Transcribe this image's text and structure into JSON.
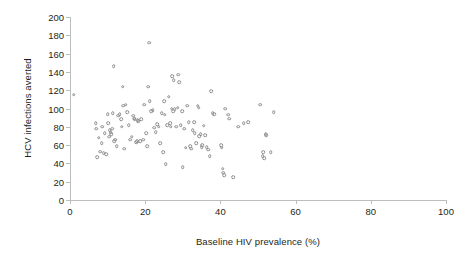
{
  "chart_data": {
    "type": "scatter",
    "title": "",
    "xlabel": "Baseline HIV prevalence (%)",
    "ylabel": "HCV infections averted",
    "xlim": [
      0,
      100
    ],
    "ylim": [
      0,
      200
    ],
    "xticks": [
      0,
      20,
      40,
      60,
      80,
      100
    ],
    "yticks": [
      0,
      20,
      40,
      60,
      80,
      100,
      120,
      140,
      160,
      180,
      200
    ],
    "grid": false,
    "legend": null,
    "marker": "open-circle",
    "marker_color": "#8d8d8d",
    "series": [
      {
        "name": "HCV infections averted vs baseline HIV prevalence",
        "points": [
          [
            1.0,
            115
          ],
          [
            6.8,
            84
          ],
          [
            7.0,
            78
          ],
          [
            7.2,
            47
          ],
          [
            7.6,
            68
          ],
          [
            8.0,
            53
          ],
          [
            8.4,
            62
          ],
          [
            8.6,
            80
          ],
          [
            9.0,
            51
          ],
          [
            9.2,
            73
          ],
          [
            9.6,
            50
          ],
          [
            10.0,
            94
          ],
          [
            10.2,
            84
          ],
          [
            10.4,
            69
          ],
          [
            10.6,
            76
          ],
          [
            10.8,
            74
          ],
          [
            11.0,
            72
          ],
          [
            11.2,
            78
          ],
          [
            11.4,
            95
          ],
          [
            11.6,
            146
          ],
          [
            11.8,
            64
          ],
          [
            12.0,
            66
          ],
          [
            12.4,
            59
          ],
          [
            12.8,
            92
          ],
          [
            13.2,
            94
          ],
          [
            13.6,
            88
          ],
          [
            13.8,
            80
          ],
          [
            14.0,
            124
          ],
          [
            14.2,
            103
          ],
          [
            14.4,
            56
          ],
          [
            14.8,
            104
          ],
          [
            15.2,
            96
          ],
          [
            15.6,
            82
          ],
          [
            16.0,
            66
          ],
          [
            16.4,
            69
          ],
          [
            16.8,
            92
          ],
          [
            17.0,
            89
          ],
          [
            17.2,
            88
          ],
          [
            17.6,
            63
          ],
          [
            17.8,
            64
          ],
          [
            18.0,
            87
          ],
          [
            18.2,
            86
          ],
          [
            18.6,
            64
          ],
          [
            19.0,
            88
          ],
          [
            19.4,
            66
          ],
          [
            19.8,
            104
          ],
          [
            20.2,
            73
          ],
          [
            20.6,
            59
          ],
          [
            20.8,
            124
          ],
          [
            21.0,
            172
          ],
          [
            21.2,
            108
          ],
          [
            21.6,
            97
          ],
          [
            22.0,
            98
          ],
          [
            22.4,
            79
          ],
          [
            22.8,
            74
          ],
          [
            23.2,
            83
          ],
          [
            23.6,
            80
          ],
          [
            24.0,
            62
          ],
          [
            24.4,
            95
          ],
          [
            24.8,
            52
          ],
          [
            25.0,
            108
          ],
          [
            25.2,
            93
          ],
          [
            25.4,
            39
          ],
          [
            25.8,
            82
          ],
          [
            26.2,
            113
          ],
          [
            26.6,
            84
          ],
          [
            26.8,
            80
          ],
          [
            27.0,
            100
          ],
          [
            27.2,
            135
          ],
          [
            27.4,
            97
          ],
          [
            27.6,
            131
          ],
          [
            27.8,
            99
          ],
          [
            28.2,
            80
          ],
          [
            28.6,
            101
          ],
          [
            28.8,
            137
          ],
          [
            29.0,
            129
          ],
          [
            29.4,
            82
          ],
          [
            29.8,
            97
          ],
          [
            30.0,
            36
          ],
          [
            30.4,
            78
          ],
          [
            30.8,
            57
          ],
          [
            31.2,
            103
          ],
          [
            31.6,
            85
          ],
          [
            32.0,
            59
          ],
          [
            32.2,
            56
          ],
          [
            32.6,
            76
          ],
          [
            33.0,
            85
          ],
          [
            33.2,
            73
          ],
          [
            33.6,
            62
          ],
          [
            34.0,
            103
          ],
          [
            34.2,
            101
          ],
          [
            34.4,
            70
          ],
          [
            34.8,
            72
          ],
          [
            35.0,
            58
          ],
          [
            35.2,
            60
          ],
          [
            35.6,
            81
          ],
          [
            36.0,
            71
          ],
          [
            36.4,
            58
          ],
          [
            36.8,
            55
          ],
          [
            37.2,
            48
          ],
          [
            37.6,
            119
          ],
          [
            38.0,
            95
          ],
          [
            38.4,
            94
          ],
          [
            40.2,
            60
          ],
          [
            40.4,
            57
          ],
          [
            40.6,
            34
          ],
          [
            40.8,
            30
          ],
          [
            41.0,
            27
          ],
          [
            41.2,
            100
          ],
          [
            42.0,
            93
          ],
          [
            42.4,
            89
          ],
          [
            43.4,
            25
          ],
          [
            44.8,
            80
          ],
          [
            46.2,
            84
          ],
          [
            47.4,
            85
          ],
          [
            50.6,
            104
          ],
          [
            51.2,
            48
          ],
          [
            51.4,
            52
          ],
          [
            51.6,
            46
          ],
          [
            52.0,
            72
          ],
          [
            52.2,
            71
          ],
          [
            53.4,
            52
          ],
          [
            54.2,
            96
          ]
        ]
      }
    ]
  },
  "axes": {
    "x_tick_labels": [
      "0",
      "20",
      "40",
      "60",
      "80",
      "100"
    ],
    "y_tick_labels": [
      "0",
      "20",
      "40",
      "60",
      "80",
      "100",
      "120",
      "140",
      "160",
      "180",
      "200"
    ]
  }
}
